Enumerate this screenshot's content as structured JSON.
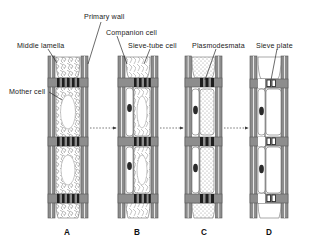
{
  "figure": {
    "type": "biology-diagram",
    "stage_count": 4
  },
  "labels": [
    {
      "key": "primary_wall",
      "text": "Primary wall",
      "x": 84,
      "y": 13
    },
    {
      "key": "companion_cell",
      "text": "Companion cell",
      "x": 106,
      "y": 29
    },
    {
      "key": "middle_lamella",
      "text": "Middle lamella",
      "x": 17,
      "y": 42
    },
    {
      "key": "sieve_tube_cell",
      "text": "Sieve-tube cell",
      "x": 128,
      "y": 42
    },
    {
      "key": "plasmodesmata",
      "text": "Plasmodesmata",
      "x": 192,
      "y": 42
    },
    {
      "key": "sieve_plate",
      "text": "Sieve plate",
      "x": 256,
      "y": 42
    },
    {
      "key": "mother_cell",
      "text": "Mother cell",
      "x": 9,
      "y": 88
    }
  ],
  "stages": [
    {
      "id": "A",
      "letter": "A",
      "x": 48,
      "letter_x": 64,
      "cytoplasm": "dense-reticulate",
      "has_nucleus": false,
      "wall_fill": "#8d8d8d"
    },
    {
      "id": "B",
      "letter": "B",
      "x": 118,
      "letter_x": 134,
      "cytoplasm": "reticulate-partial",
      "has_nucleus": true,
      "wall_fill": "#8d8d8d"
    },
    {
      "id": "C",
      "letter": "C",
      "x": 185,
      "letter_x": 201,
      "cytoplasm": "stippled",
      "has_nucleus": true,
      "wall_fill": "#8d8d8d"
    },
    {
      "id": "D",
      "letter": "D",
      "x": 250,
      "letter_x": 266,
      "cytoplasm": "clear",
      "has_nucleus": true,
      "wall_fill": "#8d8d8d"
    }
  ],
  "letters_y": 228,
  "arrows": [
    {
      "from": "A",
      "to": "B",
      "x1": 90,
      "x2": 116,
      "y": 128
    },
    {
      "from": "B",
      "to": "C",
      "x1": 160,
      "x2": 183,
      "y": 128
    },
    {
      "from": "C",
      "to": "D",
      "x1": 224,
      "x2": 248,
      "y": 128
    }
  ],
  "colors": {
    "wall": "#8d8d8d",
    "wall_dark": "#6f6f6f",
    "cross_wall": "#7a7a7a",
    "plasmodesma": "#1d1d1d",
    "lumen": "#ffffff",
    "nucleus": "#2a2a2a",
    "outline": "#3a3a3a",
    "text": "#1a1a1a",
    "background": "#ffffff",
    "leader": "#2b2b2b"
  }
}
